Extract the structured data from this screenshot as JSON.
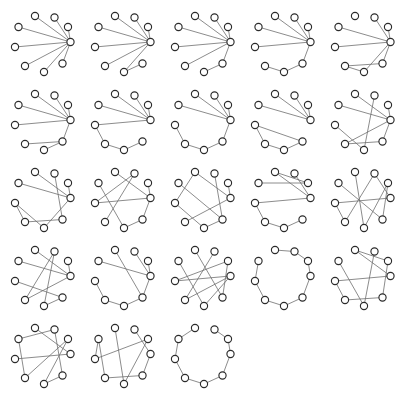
{
  "figure": {
    "title": "",
    "background_color": "#ffffff",
    "node_fill": "#ffffff",
    "node_stroke": "#2b2b2b",
    "edge_color": "#6e6e6e",
    "grid": {
      "rows": 5,
      "columns": 5,
      "cell_count": 23
    },
    "nodes_per_graph": 9,
    "node_radius": 3.6,
    "layout": "circular",
    "node_positions": [
      [
        64.5,
        36.0
      ],
      [
        56.5,
        57.5
      ],
      [
        38.0,
        66.0
      ],
      [
        19.0,
        60.0
      ],
      [
        9.0,
        41.0
      ],
      [
        12.5,
        21.0
      ],
      [
        29.0,
        10.0
      ],
      [
        48.5,
        11.5
      ],
      [
        62.0,
        21.0
      ]
    ]
  },
  "graphs": [
    {
      "id": "graph-1",
      "edges": [
        [
          0,
          1
        ],
        [
          0,
          2
        ],
        [
          0,
          3
        ],
        [
          0,
          4
        ],
        [
          0,
          5
        ],
        [
          0,
          6
        ],
        [
          0,
          7
        ],
        [
          0,
          8
        ]
      ]
    },
    {
      "id": "graph-2",
      "edges": [
        [
          0,
          2
        ],
        [
          0,
          3
        ],
        [
          0,
          4
        ],
        [
          0,
          5
        ],
        [
          0,
          6
        ],
        [
          0,
          7
        ],
        [
          0,
          8
        ],
        [
          1,
          2
        ]
      ]
    },
    {
      "id": "graph-3",
      "edges": [
        [
          0,
          1
        ],
        [
          0,
          3
        ],
        [
          0,
          4
        ],
        [
          0,
          5
        ],
        [
          0,
          6
        ],
        [
          0,
          7
        ],
        [
          0,
          8
        ],
        [
          1,
          2
        ]
      ]
    },
    {
      "id": "graph-4",
      "edges": [
        [
          0,
          1
        ],
        [
          0,
          4
        ],
        [
          0,
          5
        ],
        [
          0,
          6
        ],
        [
          0,
          7
        ],
        [
          0,
          8
        ],
        [
          1,
          2
        ],
        [
          2,
          3
        ]
      ]
    },
    {
      "id": "graph-5",
      "edges": [
        [
          0,
          1
        ],
        [
          0,
          2
        ],
        [
          0,
          4
        ],
        [
          0,
          5
        ],
        [
          0,
          7
        ],
        [
          0,
          8
        ],
        [
          1,
          3
        ],
        [
          2,
          3
        ]
      ]
    },
    {
      "id": "graph-6",
      "edges": [
        [
          0,
          1
        ],
        [
          0,
          4
        ],
        [
          0,
          5
        ],
        [
          0,
          6
        ],
        [
          0,
          7
        ],
        [
          0,
          8
        ],
        [
          1,
          2
        ],
        [
          1,
          3
        ]
      ]
    },
    {
      "id": "graph-7",
      "edges": [
        [
          0,
          4
        ],
        [
          0,
          5
        ],
        [
          0,
          6
        ],
        [
          0,
          7
        ],
        [
          0,
          8
        ],
        [
          1,
          2
        ],
        [
          2,
          3
        ],
        [
          3,
          4
        ]
      ]
    },
    {
      "id": "graph-8",
      "edges": [
        [
          0,
          1
        ],
        [
          0,
          5
        ],
        [
          0,
          6
        ],
        [
          0,
          7
        ],
        [
          0,
          8
        ],
        [
          1,
          2
        ],
        [
          2,
          3
        ],
        [
          3,
          4
        ]
      ]
    },
    {
      "id": "graph-9",
      "edges": [
        [
          0,
          5
        ],
        [
          0,
          6
        ],
        [
          0,
          7
        ],
        [
          0,
          8
        ],
        [
          1,
          2
        ],
        [
          1,
          4
        ],
        [
          2,
          3
        ],
        [
          3,
          4
        ]
      ]
    },
    {
      "id": "graph-10",
      "edges": [
        [
          0,
          1
        ],
        [
          0,
          3
        ],
        [
          0,
          5
        ],
        [
          0,
          6
        ],
        [
          0,
          8
        ],
        [
          1,
          3
        ],
        [
          2,
          4
        ],
        [
          2,
          7
        ]
      ]
    },
    {
      "id": "graph-11",
      "edges": [
        [
          0,
          2
        ],
        [
          0,
          5
        ],
        [
          0,
          6
        ],
        [
          0,
          8
        ],
        [
          1,
          3
        ],
        [
          1,
          7
        ],
        [
          2,
          4
        ],
        [
          3,
          4
        ]
      ]
    },
    {
      "id": "graph-12",
      "edges": [
        [
          0,
          1
        ],
        [
          0,
          4
        ],
        [
          0,
          6
        ],
        [
          0,
          8
        ],
        [
          1,
          2
        ],
        [
          2,
          5
        ],
        [
          3,
          7
        ],
        [
          4,
          7
        ]
      ]
    },
    {
      "id": "graph-13",
      "edges": [
        [
          0,
          3
        ],
        [
          0,
          6
        ],
        [
          0,
          8
        ],
        [
          1,
          2
        ],
        [
          1,
          7
        ],
        [
          1,
          5
        ],
        [
          2,
          4
        ],
        [
          4,
          6
        ]
      ]
    },
    {
      "id": "graph-14",
      "edges": [
        [
          0,
          4
        ],
        [
          0,
          6
        ],
        [
          0,
          7
        ],
        [
          1,
          2
        ],
        [
          2,
          3
        ],
        [
          3,
          4
        ],
        [
          5,
          8
        ],
        [
          6,
          8
        ]
      ]
    },
    {
      "id": "graph-15",
      "edges": [
        [
          0,
          4
        ],
        [
          0,
          7
        ],
        [
          1,
          5
        ],
        [
          1,
          8
        ],
        [
          2,
          6
        ],
        [
          2,
          8
        ],
        [
          3,
          4
        ],
        [
          3,
          7
        ]
      ]
    },
    {
      "id": "graph-16",
      "edges": [
        [
          0,
          3
        ],
        [
          0,
          5
        ],
        [
          0,
          6
        ],
        [
          0,
          8
        ],
        [
          1,
          2
        ],
        [
          1,
          4
        ],
        [
          2,
          7
        ],
        [
          3,
          7
        ]
      ]
    },
    {
      "id": "graph-17",
      "edges": [
        [
          0,
          1
        ],
        [
          0,
          5
        ],
        [
          0,
          7
        ],
        [
          0,
          8
        ],
        [
          1,
          2
        ],
        [
          2,
          3
        ],
        [
          3,
          4
        ],
        [
          6,
          1
        ]
      ]
    },
    {
      "id": "graph-18",
      "edges": [
        [
          0,
          2
        ],
        [
          0,
          3
        ],
        [
          0,
          4
        ],
        [
          1,
          6
        ],
        [
          1,
          8
        ],
        [
          2,
          5
        ],
        [
          3,
          7
        ],
        [
          4,
          8
        ]
      ]
    },
    {
      "id": "graph-19",
      "edges": [
        [
          0,
          1
        ],
        [
          0,
          8
        ],
        [
          1,
          2
        ],
        [
          2,
          3
        ],
        [
          3,
          4
        ],
        [
          4,
          5
        ],
        [
          6,
          7
        ],
        [
          7,
          8
        ]
      ]
    },
    {
      "id": "graph-20",
      "edges": [
        [
          0,
          4
        ],
        [
          0,
          6
        ],
        [
          1,
          3
        ],
        [
          1,
          8
        ],
        [
          2,
          5
        ],
        [
          2,
          7
        ],
        [
          3,
          4
        ],
        [
          6,
          8
        ]
      ]
    },
    {
      "id": "graph-21",
      "edges": [
        [
          0,
          4
        ],
        [
          0,
          6
        ],
        [
          1,
          2
        ],
        [
          1,
          7
        ],
        [
          2,
          8
        ],
        [
          3,
          5
        ],
        [
          3,
          8
        ],
        [
          5,
          7
        ]
      ]
    },
    {
      "id": "graph-22",
      "edges": [
        [
          0,
          1
        ],
        [
          0,
          7
        ],
        [
          1,
          3
        ],
        [
          2,
          6
        ],
        [
          2,
          8
        ],
        [
          3,
          5
        ],
        [
          4,
          5
        ],
        [
          4,
          8
        ]
      ]
    },
    {
      "id": "graph-23",
      "edges": [
        [
          0,
          1
        ],
        [
          0,
          8
        ],
        [
          1,
          2
        ],
        [
          2,
          3
        ],
        [
          3,
          4
        ],
        [
          4,
          5
        ],
        [
          5,
          6
        ],
        [
          7,
          8
        ]
      ]
    }
  ]
}
